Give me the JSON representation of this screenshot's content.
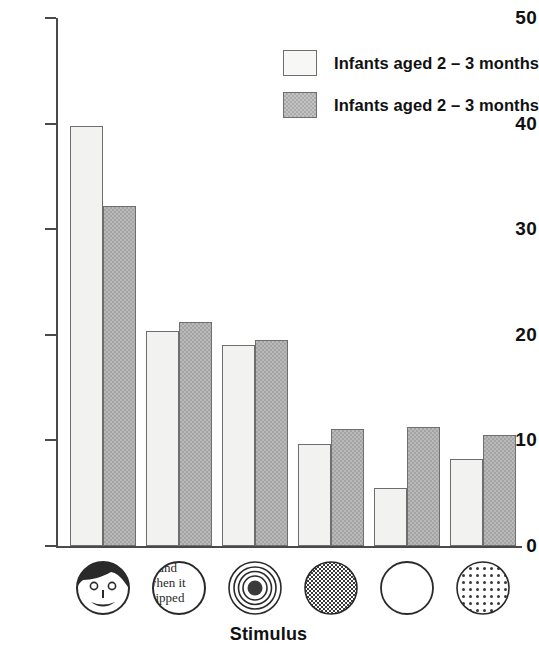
{
  "chart_data": {
    "type": "bar",
    "title": "",
    "xlabel": "Stimulus",
    "ylabel": "",
    "ylim": [
      0,
      50
    ],
    "yticks": [
      0,
      10,
      20,
      30,
      40,
      50
    ],
    "grid": false,
    "legend_position": "top-right",
    "categories": [
      "face",
      "printed text",
      "concentric circles (bullseye)",
      "checkerboard",
      "plain white circle",
      "dotted circle"
    ],
    "series": [
      {
        "name": "Infants aged 2 – 3 months",
        "fill": "light",
        "values": [
          39.8,
          20.4,
          19.0,
          9.7,
          5.5,
          8.2
        ]
      },
      {
        "name": "Infants aged 2 – 3 months",
        "fill": "dark",
        "values": [
          32.2,
          21.2,
          19.5,
          11.1,
          11.3,
          10.5
        ]
      }
    ]
  },
  "axis": {
    "y_tick_labels": [
      "50",
      "40",
      "30",
      "20",
      "10",
      "0"
    ],
    "x_title": "Stimulus"
  },
  "legend": {
    "items": [
      {
        "label": "Infants aged 2 – 3 months",
        "swatch": "light-swatch"
      },
      {
        "label": "Infants aged 2 – 3 months",
        "swatch": "dark-swatch"
      }
    ]
  },
  "stimulus_icons": [
    {
      "name": "face-icon",
      "text": ""
    },
    {
      "name": "printed-text-icon",
      "text": "ound when it hipped re"
    },
    {
      "name": "bullseye-icon",
      "text": ""
    },
    {
      "name": "checkerboard-icon",
      "text": ""
    },
    {
      "name": "plain-circle-icon",
      "text": ""
    },
    {
      "name": "dotted-circle-icon",
      "text": ""
    }
  ],
  "colors": {
    "light_bar": "#f2f2f0",
    "dark_bar": "#b9b9b9",
    "axis": "#4a4a4a",
    "text": "#111111"
  }
}
